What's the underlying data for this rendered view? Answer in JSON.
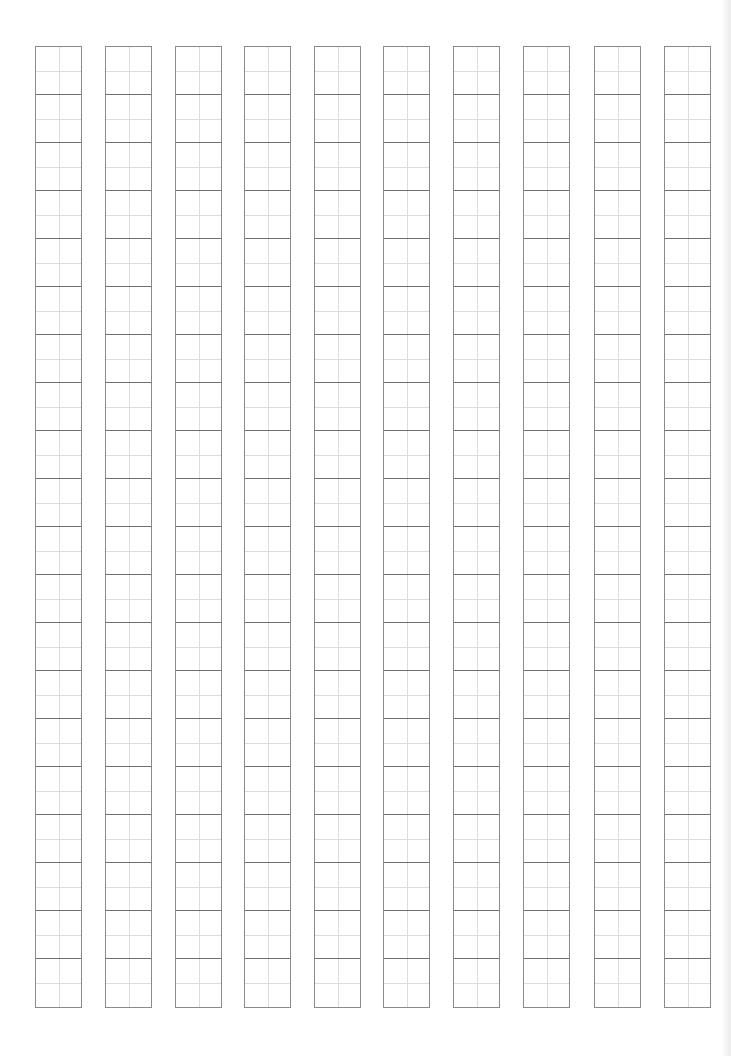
{
  "sheet": {
    "type": "writing-practice-grid",
    "columns": 10,
    "cells_per_column": 20,
    "cell_size_px": [
      47,
      48
    ],
    "grid_top_px": 46,
    "column_left_px": [
      35,
      105,
      175,
      244,
      314,
      383,
      453,
      523,
      594,
      664
    ],
    "colors": {
      "outer_line": "#8a8a8a",
      "cell_divider": "#6e6e6e",
      "guide_line": "#dcdcdc",
      "background": "#ffffff"
    }
  }
}
